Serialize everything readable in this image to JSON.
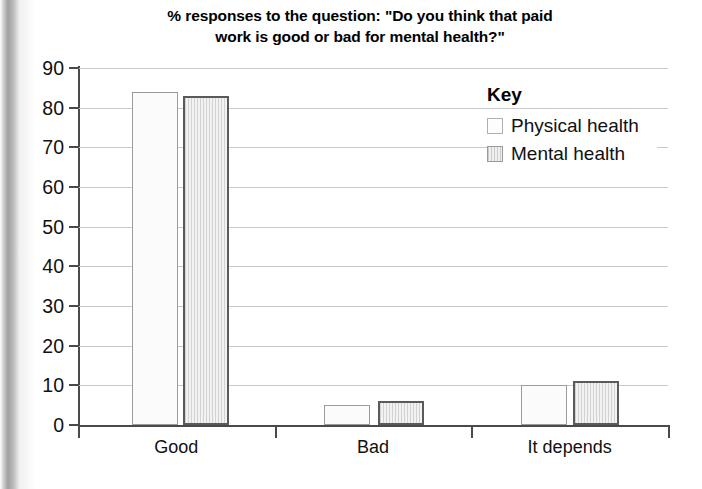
{
  "chart_data": {
    "type": "bar",
    "title": "% responses to the question: \"Do you think that paid work is good or bad for mental health?\"",
    "title_line1": "% responses to the question: \"Do you think that paid",
    "title_line2": "work is good or bad for mental health?\"",
    "categories": [
      "Good",
      "Bad",
      "It depends"
    ],
    "series": [
      {
        "name": "Physical health",
        "values": [
          84,
          5,
          10
        ],
        "swatch": "white-outline"
      },
      {
        "name": "Mental health",
        "values": [
          83,
          6,
          11
        ],
        "swatch": "gray-hatched"
      }
    ],
    "xlabel": "",
    "ylabel": "",
    "ylim": [
      0,
      90
    ],
    "ytick_step": 10,
    "yticks": [
      90,
      80,
      70,
      60,
      50,
      40,
      30,
      20,
      10,
      0
    ],
    "grid": true,
    "legend_position": "top-right",
    "legend_title": "Key",
    "colors": {
      "physical_fill": "#fbfbfb",
      "physical_border": "#9b9b9b",
      "mental_fill": "#e3e3e3",
      "mental_border": "#5a5a5a",
      "gridline": "#c9c9c9",
      "axis": "#4a4a4a",
      "text": "#111111"
    }
  }
}
